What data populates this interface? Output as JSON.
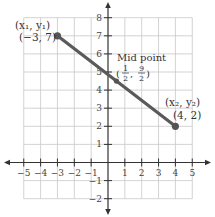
{
  "chart_data": {
    "type": "line",
    "title": "",
    "xlabel": "",
    "ylabel": "",
    "xlim": [
      -5,
      5
    ],
    "ylim": [
      -2,
      8
    ],
    "grid": true,
    "x_ticks": [
      -5,
      -4,
      -3,
      -2,
      -1,
      1,
      2,
      3,
      4,
      5
    ],
    "y_ticks": [
      -2,
      -1,
      1,
      2,
      3,
      4,
      5,
      6,
      7,
      8
    ],
    "x_tick_labels": [
      "−5",
      "−4",
      "−3",
      "−2",
      "−1",
      "1",
      "2",
      "3",
      "4",
      "5"
    ],
    "y_tick_labels": [
      "−2",
      "−1",
      "1",
      "2",
      "3",
      "4",
      "5",
      "6",
      "7",
      "8"
    ],
    "series": [
      {
        "name": "segment",
        "points": [
          [
            -3,
            7
          ],
          [
            4,
            2
          ]
        ],
        "color": "#555555"
      }
    ],
    "points": [
      {
        "name": "P1",
        "x": -3,
        "y": 7,
        "label_top": "(x₁, y₁)",
        "label_bottom": "(−3, 7)"
      },
      {
        "name": "Midpoint",
        "x": 0.5,
        "y": 4.5,
        "label_top": "Mid point",
        "label_bottom_num1": "1",
        "label_bottom_den1": "2",
        "label_bottom_num2": "9",
        "label_bottom_den2": "2"
      },
      {
        "name": "P2",
        "x": 4,
        "y": 2,
        "label_top": "(x₂, y₂)",
        "label_bottom": "(4, 2)"
      }
    ],
    "annotations": [
      "(x₁, y₁)",
      "(−3, 7)",
      "Mid point",
      "(1/2, 9/2)",
      "(x₂, y₂)",
      "(4, 2)"
    ]
  },
  "colors": {
    "grid": "#c8c8c8",
    "axis": "#333333",
    "segment": "#5a5a5a",
    "point": "#555555"
  }
}
